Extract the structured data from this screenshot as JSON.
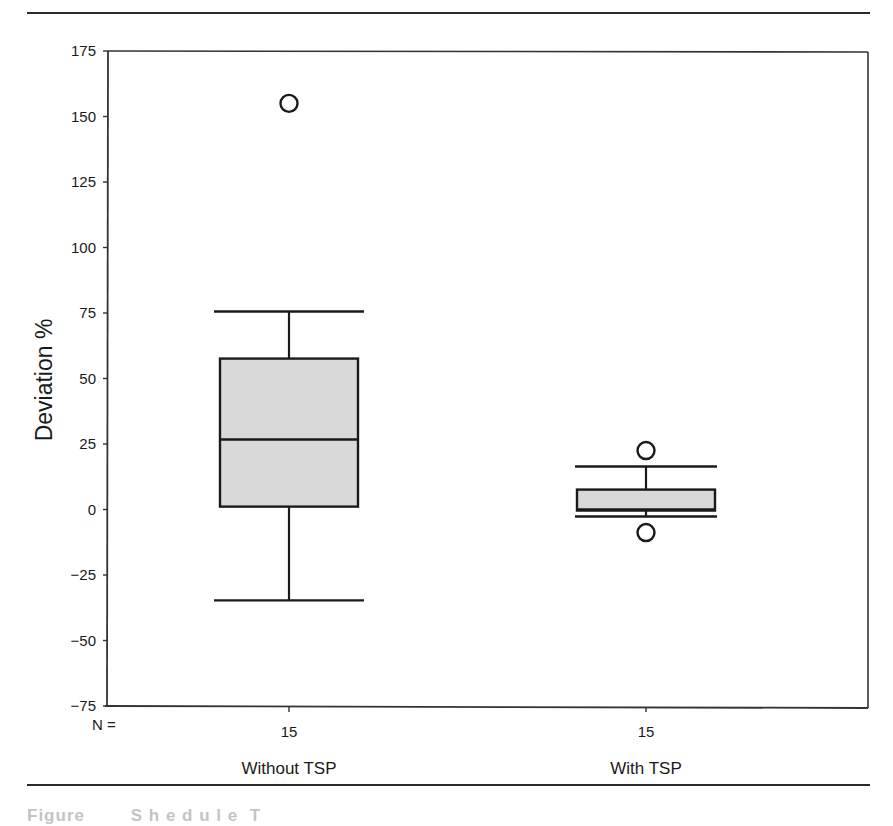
{
  "chart_data": {
    "type": "box",
    "title": "",
    "xlabel": "",
    "ylabel": "Deviation %",
    "ylim": [
      -75,
      175
    ],
    "yticks": [
      175,
      150,
      125,
      100,
      75,
      50,
      25,
      0,
      -25,
      -50,
      -75
    ],
    "ytick_labels": [
      "175",
      "150",
      "125",
      "100",
      "75",
      "50",
      "25",
      "0",
      "−25",
      "−50",
      "−75"
    ],
    "grid": false,
    "n_label": "N =",
    "categories": [
      "Without TSP",
      "With TSP"
    ],
    "series": [
      {
        "name": "Without TSP",
        "n": "15",
        "whisker_low": -34.7,
        "q1": 1.1,
        "median": 26.7,
        "q3": 57.6,
        "whisker_high": 75.6,
        "outliers": [
          155.0
        ],
        "fill": "#d9d9d9"
      },
      {
        "name": "With TSP",
        "n": "15",
        "whisker_low": -2.7,
        "q1": -0.4,
        "median": 0.0,
        "q3": 7.6,
        "whisker_high": 16.4,
        "outliers": [
          22.5,
          -8.8
        ],
        "fill": "#d9d9d9"
      }
    ]
  },
  "caption": {
    "text": "Figure ... Schedule ... (text cut off)"
  }
}
